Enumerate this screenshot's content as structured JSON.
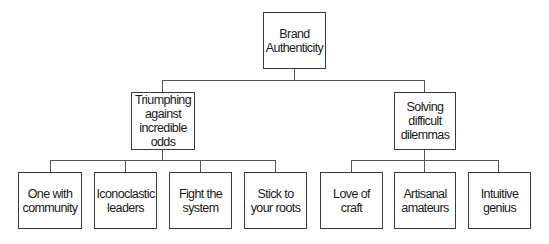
{
  "diagram": {
    "type": "hierarchy-tree",
    "root": {
      "label": "Brand Authenticity"
    },
    "branches": [
      {
        "label": "Triumphing against incredible odds",
        "children": [
          {
            "label": "One with community"
          },
          {
            "label": "Iconoclastic leaders"
          },
          {
            "label": "Fight the system"
          },
          {
            "label": "Stick to your roots"
          }
        ]
      },
      {
        "label": "Solving difficult dilemmas",
        "children": [
          {
            "label": "Love of craft"
          },
          {
            "label": "Artisanal amateurs"
          },
          {
            "label": "Intuitive genius"
          }
        ]
      }
    ],
    "colors": {
      "border": "#3a3a3a",
      "line": "#555555",
      "text": "#1a1a1a",
      "background": "#ffffff"
    }
  }
}
